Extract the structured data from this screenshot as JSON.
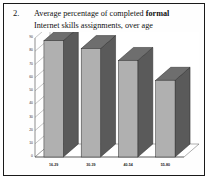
{
  "figure": {
    "number": "2.",
    "caption_line1_a": "Average percentage of completed ",
    "caption_line1_bold": "formal",
    "caption_line2": "Internet skills assignments, over age"
  },
  "colors": {
    "bar_front": "#b0b0b0",
    "bar_top": "#6e6e6e",
    "bar_side": "#5a5a5a",
    "bar_outline": "#2b2b2b",
    "grid": "#8a8a8a",
    "axis": "#5f5f5f",
    "frame": "#1a1a1a",
    "text": "#111111",
    "plot_bg": "#ffffff"
  },
  "chart_data": {
    "type": "bar",
    "title": "Average percentage of completed formal Internet skills assignments, over age",
    "xlabel": "",
    "ylabel": "",
    "categories": [
      "16-29",
      "30-39",
      "40-54",
      "55-80"
    ],
    "values": [
      88,
      82,
      73,
      58
    ],
    "ylim": [
      0,
      90
    ],
    "yticks": [
      0,
      10,
      20,
      30,
      40,
      50,
      60,
      70,
      80,
      90
    ],
    "ytick_labels": [
      "0",
      "10",
      "20",
      "30",
      "40",
      "50",
      "60",
      "70",
      "80",
      "90"
    ],
    "grid": true,
    "legend": "none",
    "style": "3d-column",
    "series": [
      {
        "name": "formal Internet skills",
        "values": [
          88,
          82,
          73,
          58
        ]
      }
    ]
  }
}
